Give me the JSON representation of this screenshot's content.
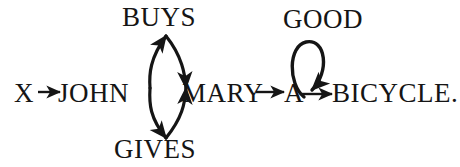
{
  "diagram": {
    "type": "dependency-graph",
    "background_color": "#ffffff",
    "stroke_color": "#151515",
    "text_color": "#151515",
    "sentence": "X JOHN MARY A BICYCLE.",
    "nodes": [
      {
        "id": "x",
        "label": "X",
        "x": 18,
        "y": 100,
        "row": "baseline"
      },
      {
        "id": "john",
        "label": "JOHN",
        "x": 60,
        "y": 100,
        "row": "baseline"
      },
      {
        "id": "mary",
        "label": "MARY",
        "x": 184,
        "y": 100,
        "row": "baseline"
      },
      {
        "id": "a",
        "label": "A",
        "x": 288,
        "y": 100,
        "row": "baseline"
      },
      {
        "id": "bicycle",
        "label": "BICYCLE.",
        "x": 334,
        "y": 100,
        "row": "baseline"
      },
      {
        "id": "buys",
        "label": "BUYS",
        "x": 124,
        "y": 6,
        "row": "above"
      },
      {
        "id": "gives",
        "label": "GIVES",
        "x": 115,
        "y": 138,
        "row": "below"
      },
      {
        "id": "good",
        "label": "GOOD",
        "x": 285,
        "y": 8,
        "row": "above"
      }
    ],
    "edges": [
      {
        "id": "x-to-john",
        "from": "X",
        "to": "JOHN",
        "style": "straight-arrow",
        "direction": "right"
      },
      {
        "id": "john-buys",
        "from": "JOHN",
        "to": "BUYS",
        "style": "curved-arc",
        "direction": "up"
      },
      {
        "id": "buys-mary",
        "from": "BUYS",
        "to": "MARY",
        "style": "curved-arc",
        "direction": "down"
      },
      {
        "id": "john-gives",
        "from": "JOHN",
        "to": "GIVES",
        "style": "curved-arc",
        "direction": "down"
      },
      {
        "id": "gives-mary",
        "from": "GIVES",
        "to": "MARY",
        "style": "curved-arc",
        "direction": "up"
      },
      {
        "id": "mary-to-a",
        "from": "MARY",
        "to": "A",
        "style": "straight-arrow",
        "direction": "right"
      },
      {
        "id": "a-good-loop",
        "from": "A",
        "to": "GOOD",
        "style": "self-loop",
        "direction": "clockwise"
      },
      {
        "id": "a-to-bicycle",
        "from": "A",
        "to": "BICYCLE.",
        "style": "straight-arrow",
        "direction": "right"
      }
    ]
  }
}
